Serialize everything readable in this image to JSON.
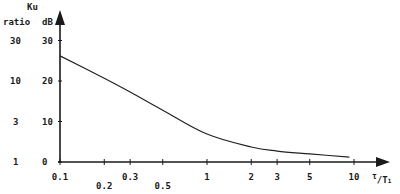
{
  "chart_data": {
    "type": "line",
    "title": "",
    "xlabel": "τ/T₁",
    "ylabel": "Ku",
    "y_units": [
      "ratio",
      "dB"
    ],
    "x_scale": "log",
    "xlim": [
      0.1,
      10
    ],
    "ylim": [
      0,
      30
    ],
    "grid": false,
    "legend": null,
    "x_ticks": [
      "0.1",
      "0.2",
      "0.3",
      "0.5",
      "1",
      "2",
      "3",
      "5",
      "10"
    ],
    "x_tick_values": [
      0.1,
      0.2,
      0.3,
      0.5,
      1,
      2,
      3,
      5,
      10
    ],
    "y_ticks_db": [
      "0",
      "10",
      "20",
      "30"
    ],
    "y_ticks_ratio": [
      "1",
      "3",
      "10",
      "30"
    ],
    "series": [
      {
        "name": "Ku (dB)",
        "x": [
          0.1,
          0.2,
          0.3,
          0.5,
          1,
          2,
          3,
          5,
          9.3
        ],
        "y": [
          26.2,
          20.7,
          17.3,
          12.8,
          6.9,
          3.7,
          2.7,
          2.0,
          1.2
        ]
      }
    ]
  },
  "labels": {
    "ku": "Ku",
    "ratio": "ratio",
    "db": "dB",
    "x_axis_tau": "τ",
    "x_axis_t": "T",
    "x_axis_sub": "1"
  }
}
